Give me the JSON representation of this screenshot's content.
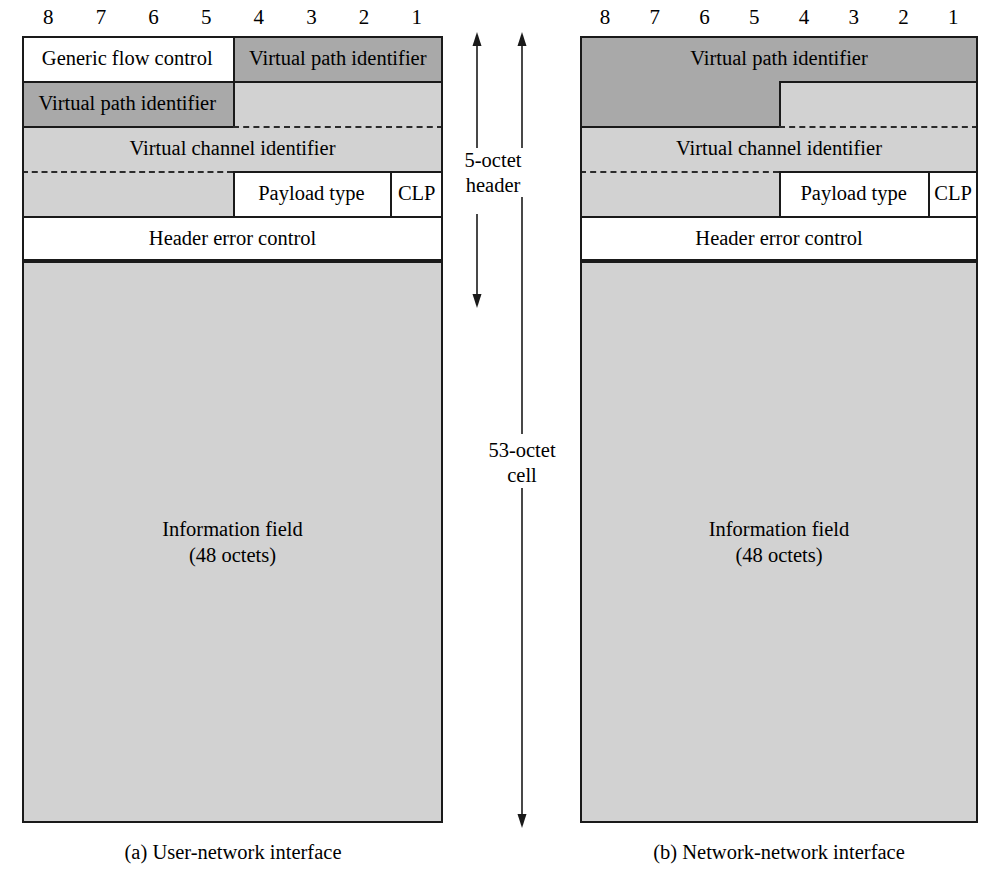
{
  "figure": {
    "bit_labels": [
      "8",
      "7",
      "6",
      "5",
      "4",
      "3",
      "2",
      "1"
    ],
    "colors": {
      "white": "#ffffff",
      "light_gray": "#d2d2d2",
      "dark_gray": "#a9a9a9",
      "line": "#1a1a1a"
    }
  },
  "measurements": {
    "header": "5-octet\nheader",
    "header_line1": "5-octet",
    "header_line2": "header",
    "cell": "53-octet\ncell",
    "cell_line1": "53-octet",
    "cell_line2": "cell"
  },
  "diagram_a": {
    "caption": "(a) User-network interface",
    "bit_labels": [
      "8",
      "7",
      "6",
      "5",
      "4",
      "3",
      "2",
      "1"
    ],
    "fields": [
      {
        "name": "generic-flow-control",
        "label": "Generic flow control",
        "row": 1,
        "bits_from": 8,
        "bits_to": 5,
        "fill": "white"
      },
      {
        "name": "virtual-path-identifier-row1",
        "label": "Virtual path identifier",
        "row": 1,
        "bits_from": 4,
        "bits_to": 1,
        "fill": "dark"
      },
      {
        "name": "virtual-path-identifier-row2",
        "label": "Virtual path identifier",
        "row": 2,
        "bits_from": 8,
        "bits_to": 5,
        "fill": "dark"
      },
      {
        "name": "virtual-channel-identifier-row2",
        "label": "",
        "row": 2,
        "bits_from": 4,
        "bits_to": 1,
        "fill": "light"
      },
      {
        "name": "virtual-channel-identifier-row3",
        "label": "Virtual channel identifier",
        "row": 3,
        "bits_from": 8,
        "bits_to": 1,
        "fill": "light"
      },
      {
        "name": "virtual-channel-identifier-row4",
        "label": "",
        "row": 4,
        "bits_from": 8,
        "bits_to": 5,
        "fill": "light"
      },
      {
        "name": "payload-type",
        "label": "Payload type",
        "row": 4,
        "bits_from": 4,
        "bits_to": 2,
        "fill": "white"
      },
      {
        "name": "cell-loss-priority",
        "label": "CLP",
        "row": 4,
        "bits_from": 1,
        "bits_to": 1,
        "fill": "white"
      },
      {
        "name": "header-error-control",
        "label": "Header error control",
        "row": 5,
        "bits_from": 8,
        "bits_to": 1,
        "fill": "white"
      }
    ],
    "information_field": {
      "name": "information-field",
      "line1": "Information field",
      "line2": "(48 octets)",
      "fill": "light"
    }
  },
  "diagram_b": {
    "caption": "(b) Network-network interface",
    "bit_labels": [
      "8",
      "7",
      "6",
      "5",
      "4",
      "3",
      "2",
      "1"
    ],
    "fields": [
      {
        "name": "virtual-path-identifier-row1",
        "label": "Virtual path identifier",
        "row": 1,
        "bits_from": 8,
        "bits_to": 1,
        "fill": "dark"
      },
      {
        "name": "virtual-path-identifier-row2",
        "label": "",
        "row": 2,
        "bits_from": 8,
        "bits_to": 5,
        "fill": "dark"
      },
      {
        "name": "virtual-channel-identifier-row2",
        "label": "",
        "row": 2,
        "bits_from": 4,
        "bits_to": 1,
        "fill": "light"
      },
      {
        "name": "virtual-channel-identifier-row3",
        "label": "Virtual channel identifier",
        "row": 3,
        "bits_from": 8,
        "bits_to": 1,
        "fill": "light"
      },
      {
        "name": "virtual-channel-identifier-row4",
        "label": "",
        "row": 4,
        "bits_from": 8,
        "bits_to": 5,
        "fill": "light"
      },
      {
        "name": "payload-type",
        "label": "Payload type",
        "row": 4,
        "bits_from": 4,
        "bits_to": 2,
        "fill": "white"
      },
      {
        "name": "cell-loss-priority",
        "label": "CLP",
        "row": 4,
        "bits_from": 1,
        "bits_to": 1,
        "fill": "white"
      },
      {
        "name": "header-error-control",
        "label": "Header error control",
        "row": 5,
        "bits_from": 8,
        "bits_to": 1,
        "fill": "white"
      }
    ],
    "information_field": {
      "name": "information-field",
      "line1": "Information field",
      "line2": "(48 octets)",
      "fill": "light"
    }
  }
}
